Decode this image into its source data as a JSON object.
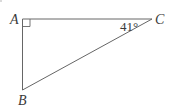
{
  "figure": {
    "type": "right-triangle",
    "stroke_color": "#666666",
    "text_color": "#3a3a3a",
    "vertices": {
      "A": {
        "label": "A",
        "x": 22.5,
        "y": 19
      },
      "B": {
        "label": "B",
        "x": 22.5,
        "y": 90
      },
      "C": {
        "label": "C",
        "x": 152,
        "y": 19
      }
    },
    "right_angle_at": "A",
    "angle_label": {
      "vertex": "C",
      "text": "41°"
    }
  }
}
